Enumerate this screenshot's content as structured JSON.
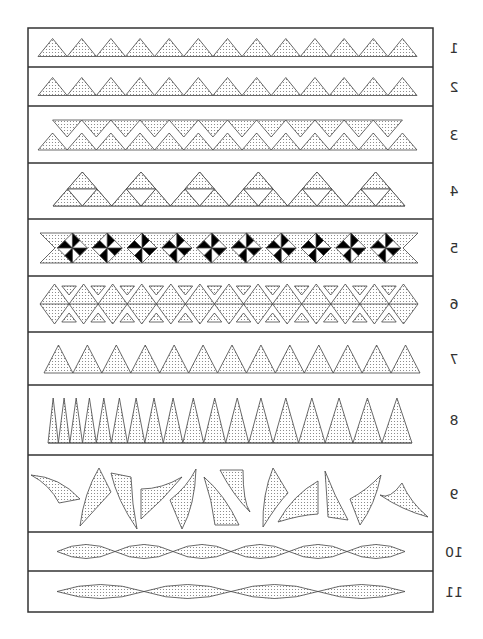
{
  "diagram": {
    "frame": {
      "x": 28,
      "y": 28,
      "width": 405,
      "height": 584,
      "stroke": "#333333"
    },
    "fill_pattern": {
      "dot_color": "#777777",
      "background": "#ffffff",
      "spacing": 3
    },
    "rows": [
      {
        "label": "1",
        "top": 28,
        "bottom": 67,
        "pattern": "triangles",
        "count": 13,
        "x0": 38,
        "x1": 417
      },
      {
        "label": "2",
        "top": 67,
        "bottom": 106,
        "pattern": "triangles",
        "count": 13,
        "x0": 38,
        "x1": 417
      },
      {
        "label": "3",
        "top": 106,
        "bottom": 163,
        "pattern": "double-zigzag",
        "count": 13,
        "x0": 38,
        "x1": 417
      },
      {
        "label": "4",
        "top": 163,
        "bottom": 219,
        "pattern": "compound-triangles",
        "count": 6,
        "x0": 53,
        "x1": 405
      },
      {
        "label": "5",
        "top": 219,
        "bottom": 276,
        "pattern": "pinwheel-band",
        "count": 10,
        "x0": 40,
        "x1": 418
      },
      {
        "label": "6",
        "top": 276,
        "bottom": 332,
        "pattern": "diamond-chain",
        "count": 13,
        "x0": 40,
        "x1": 418
      },
      {
        "label": "7",
        "top": 332,
        "bottom": 385,
        "pattern": "tall-triangles",
        "count": 13,
        "x0": 44,
        "x1": 420
      },
      {
        "label": "8",
        "top": 385,
        "bottom": 455,
        "pattern": "spikes",
        "count": 18,
        "x0": 48,
        "x1": 412
      },
      {
        "label": "9",
        "top": 455,
        "bottom": 532,
        "pattern": "curved-shards",
        "count": 12,
        "x0": 30,
        "x1": 430
      },
      {
        "label": "10",
        "top": 532,
        "bottom": 571,
        "pattern": "twisted-lens",
        "count": 6,
        "x0": 57,
        "x1": 405
      },
      {
        "label": "11",
        "top": 571,
        "bottom": 612,
        "pattern": "twisted-lens",
        "count": 4,
        "x0": 57,
        "x1": 405
      }
    ]
  }
}
